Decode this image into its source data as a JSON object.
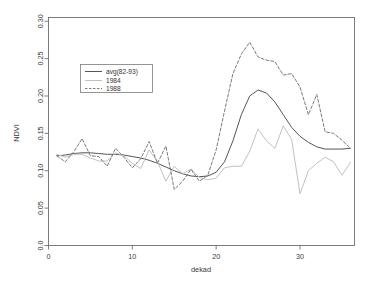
{
  "chart_data": {
    "type": "line",
    "title": "",
    "xlabel": "dekad",
    "ylabel": "NDVI",
    "xlim": [
      0,
      36.5
    ],
    "ylim": [
      0.0,
      0.305
    ],
    "xticks": [
      0,
      10,
      20,
      30
    ],
    "xticklabels": [
      "0",
      "10",
      "20",
      "30"
    ],
    "yticks": [
      0.0,
      0.05,
      0.1,
      0.15,
      0.2,
      0.25,
      0.3
    ],
    "yticklabels": [
      "0.0",
      "0.05",
      "0.10",
      "0.15",
      "0.20",
      "0.25",
      "0.30"
    ],
    "grid": false,
    "legend_position": "upper left",
    "x": [
      1,
      2,
      3,
      4,
      5,
      6,
      7,
      8,
      9,
      10,
      11,
      12,
      13,
      14,
      15,
      16,
      17,
      18,
      19,
      20,
      21,
      22,
      23,
      24,
      25,
      26,
      27,
      28,
      29,
      30,
      31,
      32,
      33,
      34,
      35,
      36
    ],
    "series": [
      {
        "name": "avg(82-93)",
        "style": "solid",
        "color": "#555555",
        "values": [
          0.12,
          0.121,
          0.123,
          0.124,
          0.124,
          0.123,
          0.122,
          0.122,
          0.121,
          0.119,
          0.117,
          0.114,
          0.11,
          0.105,
          0.1,
          0.096,
          0.093,
          0.092,
          0.093,
          0.098,
          0.112,
          0.14,
          0.175,
          0.2,
          0.208,
          0.204,
          0.192,
          0.175,
          0.158,
          0.146,
          0.138,
          0.132,
          0.129,
          0.129,
          0.129,
          0.13
        ]
      },
      {
        "name": "1984",
        "style": "solid",
        "color": "#c2c2c2",
        "values": [
          0.122,
          0.118,
          0.122,
          0.122,
          0.117,
          0.113,
          0.113,
          0.124,
          0.12,
          0.11,
          0.103,
          0.128,
          0.112,
          0.086,
          0.106,
          0.096,
          0.102,
          0.091,
          0.088,
          0.09,
          0.104,
          0.106,
          0.106,
          0.126,
          0.156,
          0.14,
          0.13,
          0.16,
          0.142,
          0.069,
          0.1,
          0.11,
          0.118,
          0.112,
          0.094,
          0.111
        ]
      },
      {
        "name": "1988",
        "style": "dashed",
        "color": "#6b6b6b",
        "values": [
          0.12,
          0.112,
          0.125,
          0.143,
          0.12,
          0.119,
          0.106,
          0.13,
          0.118,
          0.104,
          0.116,
          0.139,
          0.11,
          0.133,
          0.075,
          0.086,
          0.102,
          0.086,
          0.094,
          0.128,
          0.18,
          0.23,
          0.256,
          0.272,
          0.252,
          0.248,
          0.246,
          0.228,
          0.23,
          0.212,
          0.175,
          0.202,
          0.152,
          0.15,
          0.141,
          0.13
        ]
      }
    ]
  }
}
